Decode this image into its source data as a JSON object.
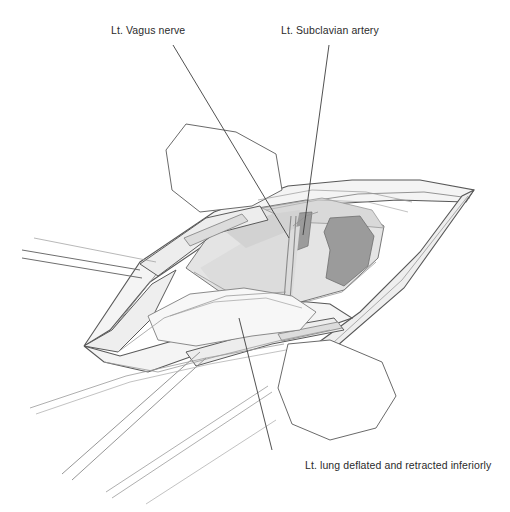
{
  "figure": {
    "kind": "anatomical-line-illustration",
    "background_color": "#ffffff",
    "ink_color": "#4a4a4a",
    "label_color": "#2b2b2b"
  },
  "labels": {
    "vagus": {
      "text": "Lt. Vagus nerve",
      "leader_from": [
        173,
        45
      ],
      "leader_to": [
        289,
        238
      ]
    },
    "subclavian": {
      "text": "Lt. Subclavian artery",
      "leader_from": [
        329,
        45
      ],
      "leader_to": [
        303,
        235
      ]
    },
    "lung": {
      "text": "Lt. lung deflated and retracted inferiorly",
      "leader_from": [
        272,
        450
      ],
      "leader_to": [
        239,
        318
      ]
    }
  },
  "palette": {
    "outline": "#4a4a4a",
    "outline_light": "#8d8d8d",
    "tissue_pale": "#f2f2f2",
    "tissue_light": "#e2e2e2",
    "tissue_mid": "#d2d2d2",
    "tissue_shade": "#c4c4c4",
    "tissue_dark": "#9e9e9e",
    "tissue_darker": "#8e8e8e",
    "drape_white": "#ffffff",
    "retractor_fill": "#ededed"
  },
  "structures": [
    {
      "name": "chest-wall-upper-flap",
      "fill": "tissue_pale"
    },
    {
      "name": "chest-wall-lower-flap",
      "fill": "tissue_pale"
    },
    {
      "name": "surgical-drape-upper",
      "fill": "drape_white"
    },
    {
      "name": "surgical-drape-lower-right",
      "fill": "drape_white"
    },
    {
      "name": "thoracic-cavity-floor",
      "fill": "tissue_light"
    },
    {
      "name": "lt-subclavian-artery",
      "fill": "tissue_dark"
    },
    {
      "name": "aortic-arch-shadow",
      "fill": "tissue_darker"
    },
    {
      "name": "lt-vagus-nerve",
      "fill": "tissue_mid"
    },
    {
      "name": "deflated-lt-lung",
      "fill": "tissue_pale"
    },
    {
      "name": "retractor-blade-upper",
      "fill": "retractor_fill"
    },
    {
      "name": "retractor-blade-lower",
      "fill": "retractor_fill"
    },
    {
      "name": "retractor-arm-left-upper",
      "fill": "retractor_fill"
    },
    {
      "name": "retractor-arm-left-lower",
      "fill": "retractor_fill"
    }
  ]
}
